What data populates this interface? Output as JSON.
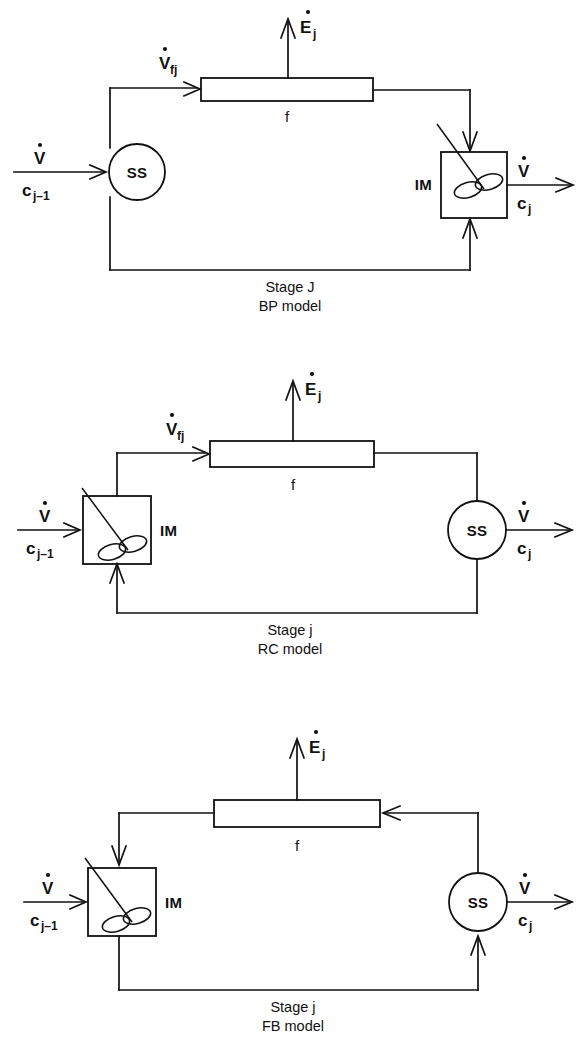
{
  "document": {
    "kind": "process-flow-diagram-set",
    "panel_count": 3
  },
  "symbols": {
    "volumetric_flow": "V",
    "volumetric_flow_dot": "˙",
    "feed_flow": "V",
    "feed_flow_sub": "fj",
    "energy_rate": "E",
    "energy_rate_sub": "j",
    "conc_in": "c",
    "conc_in_sub": "j–1",
    "conc_out": "c",
    "conc_out_sub": "j",
    "separator_label": "SS",
    "mixer_label": "IM",
    "filter_label": "f"
  },
  "panels": [
    {
      "id": "bp",
      "caption_line1": "Stage J",
      "caption_line2": "BP model",
      "nodes": [
        {
          "name": "SS",
          "type": "circle",
          "label": "SS"
        },
        {
          "name": "f",
          "type": "rect",
          "label": "f"
        },
        {
          "name": "IM",
          "type": "box-impeller",
          "label": "IM",
          "label_side": "left"
        }
      ],
      "inlet": {
        "top": "V",
        "bottom_base": "c",
        "bottom_sub": "j–1"
      },
      "outlet": {
        "top": "V",
        "bottom_base": "c",
        "bottom_sub": "j"
      },
      "vent": {
        "base": "E",
        "sub": "j"
      },
      "feed_branch": {
        "base": "V",
        "sub": "fj"
      },
      "flow_order": "inlet → SS → f → IM → outlet; SS bottom → IM bottom",
      "filter_flow_direction": "left-to-right"
    },
    {
      "id": "rc",
      "caption_line1": "Stage j",
      "caption_line2": "RC model",
      "nodes": [
        {
          "name": "IM",
          "type": "box-impeller",
          "label": "IM",
          "label_side": "right"
        },
        {
          "name": "f",
          "type": "rect",
          "label": "f"
        },
        {
          "name": "SS",
          "type": "circle",
          "label": "SS"
        }
      ],
      "inlet": {
        "top": "V",
        "bottom_base": "c",
        "bottom_sub": "j–1"
      },
      "outlet": {
        "top": "V",
        "bottom_base": "c",
        "bottom_sub": "j"
      },
      "vent": {
        "base": "E",
        "sub": "j"
      },
      "feed_branch": {
        "base": "V",
        "sub": "fj"
      },
      "flow_order": "inlet → IM → f → SS → outlet; SS bottom → IM bottom",
      "filter_flow_direction": "left-to-right"
    },
    {
      "id": "fb",
      "caption_line1": "Stage j",
      "caption_line2": "FB model",
      "nodes": [
        {
          "name": "IM",
          "type": "box-impeller",
          "label": "IM",
          "label_side": "right"
        },
        {
          "name": "f",
          "type": "rect",
          "label": "f"
        },
        {
          "name": "SS",
          "type": "circle",
          "label": "SS"
        }
      ],
      "inlet": {
        "top": "V",
        "bottom_base": "c",
        "bottom_sub": "j–1"
      },
      "outlet": {
        "top": "V",
        "bottom_base": "c",
        "bottom_sub": "j"
      },
      "vent": {
        "base": "E",
        "sub": "j"
      },
      "feed_branch": null,
      "flow_order": "inlet → IM → bottom → SS → up → f → left → down into IM; SS → outlet",
      "filter_flow_direction": "right-to-left"
    }
  ],
  "colors": {
    "ink": "#111111",
    "paper": "#ffffff"
  }
}
